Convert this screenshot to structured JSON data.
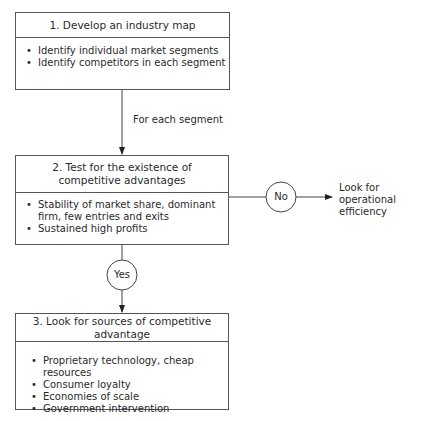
{
  "steps": [
    {
      "title": "1. Develop an industry map",
      "bullets": [
        "Identify individual market segments",
        "Identify competitors in each segment"
      ]
    },
    {
      "title": "2. Test for the existence of competitive advantages",
      "bullets": [
        "Stability of market share, dominant firm, few entries and exits",
        "Sustained high profits"
      ]
    },
    {
      "title": "3. Look for sources of competitive advantage",
      "bullets": [
        "Proprietary technology, cheap resources",
        "Consumer loyalty",
        "Economies of scale",
        "Government intervention"
      ]
    }
  ],
  "connectors": {
    "step1_to_step2_label": "For each segment",
    "no_label": "No",
    "yes_label": "Yes",
    "no_outcome": "Look for operational efficiency"
  }
}
